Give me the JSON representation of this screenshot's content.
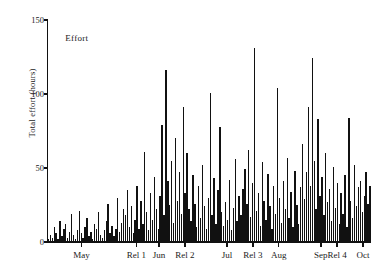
{
  "figure": {
    "background_color": "#ffffff",
    "ink_color": "#111111",
    "width": 384,
    "height": 277
  },
  "annotation_label": "Effort",
  "axis": {
    "y_label": "Total effort (hours)",
    "y_ticks": [
      0,
      50,
      100,
      150
    ],
    "y_tick_labels": [
      "0",
      "50",
      "100",
      "150"
    ],
    "y_min": 0,
    "y_max": 150,
    "x_tick_labels": [
      "May",
      "Rel 1",
      "Jun",
      "Rel 2",
      "Jul",
      "Rel 3",
      "Aug",
      "Sep",
      "Rel 4",
      "Oct"
    ]
  },
  "chart_data": {
    "type": "bar",
    "title": "",
    "subtitle": "",
    "xlabel": "",
    "ylabel": "Total effort (hours)",
    "ylim": [
      0,
      150
    ],
    "grid": false,
    "legend": null,
    "annotations": [
      {
        "text": "Effort",
        "x_frac": 0.055,
        "y_value": 138
      }
    ],
    "x_tick_positions_frac": [
      0.105,
      0.275,
      0.345,
      0.425,
      0.555,
      0.635,
      0.715,
      0.845,
      0.895,
      0.975
    ],
    "categories": [
      "Apr 22",
      "Apr 23",
      "Apr 24",
      "Apr 25",
      "Apr 26",
      "Apr 27",
      "Apr 28",
      "Apr 29",
      "Apr 30",
      "May 1",
      "May 2",
      "May 3",
      "May 4",
      "May 5",
      "May 6",
      "May 7",
      "May 8",
      "May 9",
      "May 10",
      "May 11",
      "May 12",
      "May 13",
      "May 14",
      "May 15",
      "May 16",
      "May 17",
      "May 18",
      "May 19",
      "May 20",
      "May 21",
      "May 22",
      "May 23",
      "May 24",
      "May 25",
      "May 26",
      "May 27",
      "May 28",
      "May 29",
      "May 30",
      "May 31",
      "Jun 1",
      "Jun 2",
      "Jun 3",
      "Jun 4",
      "Jun 5",
      "Jun 6",
      "Jun 7",
      "Jun 8",
      "Jun 9",
      "Jun 10",
      "Jun 11",
      "Jun 12",
      "Jun 13",
      "Jun 14",
      "Jun 15",
      "Jun 16",
      "Jun 17",
      "Jun 18",
      "Jun 19",
      "Jun 20",
      "Jun 21",
      "Jun 22",
      "Jun 23",
      "Jun 24",
      "Jun 25",
      "Jun 26",
      "Jun 27",
      "Jun 28",
      "Jun 29",
      "Jun 30",
      "Jul 1",
      "Jul 2",
      "Jul 3",
      "Jul 4",
      "Jul 5",
      "Jul 6",
      "Jul 7",
      "Jul 8",
      "Jul 9",
      "Jul 10",
      "Jul 11",
      "Jul 12",
      "Jul 13",
      "Jul 14",
      "Jul 15",
      "Jul 16",
      "Jul 17",
      "Jul 18",
      "Jul 19",
      "Jul 20",
      "Jul 21",
      "Jul 22",
      "Jul 23",
      "Jul 24",
      "Jul 25",
      "Jul 26",
      "Jul 27",
      "Jul 28",
      "Jul 29",
      "Jul 30",
      "Jul 31",
      "Aug 1",
      "Aug 2",
      "Aug 3",
      "Aug 4",
      "Aug 5",
      "Aug 6",
      "Aug 7",
      "Aug 8",
      "Aug 9",
      "Aug 10",
      "Aug 11",
      "Aug 12",
      "Aug 13",
      "Aug 14",
      "Aug 15",
      "Aug 16",
      "Aug 17",
      "Aug 18",
      "Aug 19",
      "Aug 20",
      "Aug 21",
      "Aug 22",
      "Aug 23",
      "Aug 24",
      "Aug 25",
      "Aug 26",
      "Aug 27",
      "Aug 28",
      "Aug 29",
      "Aug 30",
      "Aug 31",
      "Sep 1",
      "Sep 2",
      "Sep 3",
      "Sep 4",
      "Sep 5",
      "Sep 6",
      "Sep 7",
      "Sep 8",
      "Sep 9",
      "Sep 10",
      "Sep 11",
      "Sep 12",
      "Sep 13",
      "Sep 14",
      "Sep 15",
      "Sep 16",
      "Sep 17",
      "Sep 18",
      "Sep 19",
      "Sep 20",
      "Sep 21",
      "Sep 22",
      "Sep 23",
      "Sep 24",
      "Sep 25",
      "Sep 26",
      "Sep 27",
      "Sep 28",
      "Sep 29",
      "Sep 30",
      "Oct 1",
      "Oct 2",
      "Oct 3",
      "Oct 4",
      "Oct 5",
      "Oct 6"
    ],
    "values": [
      2,
      5,
      3,
      10,
      6,
      2,
      14,
      4,
      9,
      12,
      3,
      7,
      19,
      5,
      2,
      8,
      21,
      6,
      3,
      10,
      16,
      4,
      7,
      2,
      12,
      9,
      20,
      5,
      3,
      8,
      14,
      26,
      6,
      11,
      4,
      9,
      30,
      7,
      13,
      22,
      18,
      35,
      10,
      24,
      6,
      15,
      38,
      9,
      28,
      12,
      61,
      20,
      8,
      33,
      15,
      44,
      22,
      9,
      31,
      79,
      18,
      116,
      41,
      25,
      55,
      13,
      70,
      28,
      47,
      19,
      91,
      33,
      60,
      22,
      14,
      45,
      26,
      10,
      38,
      16,
      52,
      24,
      9,
      30,
      101,
      18,
      43,
      12,
      35,
      78,
      20,
      11,
      27,
      15,
      42,
      8,
      23,
      56,
      14,
      31,
      18,
      36,
      49,
      26,
      62,
      17,
      40,
      131,
      21,
      33,
      11,
      54,
      28,
      15,
      46,
      24,
      9,
      38,
      19,
      104,
      30,
      13,
      41,
      22,
      57,
      16,
      34,
      10,
      48,
      25,
      12,
      37,
      66,
      29,
      47,
      91,
      38,
      124,
      55,
      22,
      83,
      31,
      44,
      18,
      60,
      27,
      36,
      14,
      51,
      23,
      40,
      12,
      33,
      19,
      45,
      10,
      84,
      28,
      16,
      52,
      24,
      37,
      41,
      20,
      31,
      47,
      26,
      38
    ],
    "bar_color": "#111111"
  }
}
